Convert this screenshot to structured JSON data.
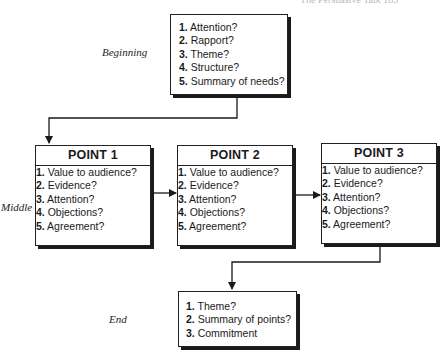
{
  "running_header": "The Persuasive Talk   185",
  "stages": {
    "beginning": "Beginning",
    "middle": "Middle",
    "end": "End"
  },
  "beginning_box": {
    "items": [
      {
        "num": "1.",
        "text": "Attention?"
      },
      {
        "num": "2.",
        "text": "Rapport?"
      },
      {
        "num": "3.",
        "text": "Theme?"
      },
      {
        "num": "4.",
        "text": "Structure?"
      },
      {
        "num": "5.",
        "text": "Summary of needs?"
      }
    ]
  },
  "points": [
    {
      "title": "POINT 1",
      "items": [
        {
          "num": "1.",
          "text": "Value to audience?"
        },
        {
          "num": "2.",
          "text": "Evidence?"
        },
        {
          "num": "3.",
          "text": "Attention?"
        },
        {
          "num": "4.",
          "text": "Objections?"
        },
        {
          "num": "5.",
          "text": "Agreement?"
        }
      ]
    },
    {
      "title": "POINT 2",
      "items": [
        {
          "num": "1.",
          "text": "Value to audience?"
        },
        {
          "num": "2.",
          "text": "Evidence?"
        },
        {
          "num": "3.",
          "text": "Attention?"
        },
        {
          "num": "4.",
          "text": "Objections?"
        },
        {
          "num": "5.",
          "text": "Agreement?"
        }
      ]
    },
    {
      "title": "POINT 3",
      "items": [
        {
          "num": "1.",
          "text": "Value to audience?"
        },
        {
          "num": "2.",
          "text": "Evidence?"
        },
        {
          "num": "3.",
          "text": "Attention?"
        },
        {
          "num": "4.",
          "text": "Objections?"
        },
        {
          "num": "5.",
          "text": "Agreement?"
        }
      ]
    }
  ],
  "end_box": {
    "items": [
      {
        "num": "1.",
        "text": "Theme?"
      },
      {
        "num": "2.",
        "text": "Summary of points?"
      },
      {
        "num": "3.",
        "text": "Commitment"
      }
    ]
  },
  "colors": {
    "line": "#1a1a1a",
    "background": "#ffffff"
  }
}
